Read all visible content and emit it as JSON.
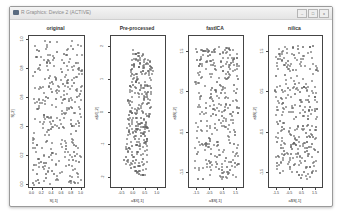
{
  "window": {
    "title": "R Graphics: Device 2 (ACTIVE)",
    "controls": {
      "minimize": "–",
      "maximize": "□",
      "close": "x"
    }
  },
  "chart_data": [
    {
      "type": "scatter",
      "title": "original",
      "xlabel": "S[,1]",
      "ylabel": "S[,2]",
      "xlim": [
        0.0,
        1.0
      ],
      "ylim": [
        0.0,
        1.0
      ],
      "xticks": [
        "0.0",
        "0.2",
        "0.4",
        "0.6",
        "0.8",
        "1.0"
      ],
      "yticks": [
        "0.0",
        "0.2",
        "0.4",
        "0.6",
        "0.8",
        "1.0"
      ],
      "distribution": "uniform square",
      "n_points": 500
    },
    {
      "type": "scatter",
      "title": "Pre-processed",
      "xlabel": "a$X[,1]",
      "ylabel": "a$X[,2]",
      "xlim": [
        -0.8,
        1.2
      ],
      "ylim": [
        -2.2,
        2.2
      ],
      "xticks": [
        "-0.5",
        "0.0",
        "0.5",
        "1.0"
      ],
      "yticks": [
        "-2",
        "-1",
        "0",
        "1",
        "2"
      ],
      "distribution": "sheared parallelogram",
      "n_points": 500
    },
    {
      "type": "scatter",
      "title": "fastICA",
      "xlabel": "a$S[,1]",
      "ylabel": "a$S[,2]",
      "xlim": [
        -1.8,
        1.8
      ],
      "ylim": [
        -1.8,
        1.8
      ],
      "xticks": [
        "-1.5",
        "-0.5",
        "0.5",
        "1.5"
      ],
      "yticks": [
        "-1.5",
        "-0.5",
        "0.5",
        "1.5"
      ],
      "distribution": "uniform square",
      "n_points": 500
    },
    {
      "type": "scatter",
      "title": "nilica",
      "xlabel": "a$S[,1]",
      "ylabel": "a$S[,2]",
      "xlim": [
        -1.8,
        1.8
      ],
      "ylim": [
        -1.8,
        1.8
      ],
      "xticks": [
        "-1.5",
        "-0.5",
        "0.5",
        "1.5"
      ],
      "yticks": [
        "-1.5",
        "-0.5",
        "0.5",
        "1.5"
      ],
      "distribution": "uniform square",
      "n_points": 500
    }
  ]
}
